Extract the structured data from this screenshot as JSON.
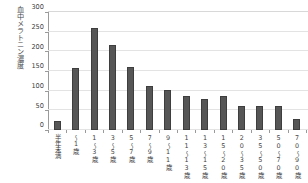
{
  "chart_data": {
    "type": "bar",
    "title": "",
    "ylabel": "血中メラトニン濃度（pg/ml）",
    "ylabel_parts": [
      "血中メラトニン濃度",
      "（pg/㎖）"
    ],
    "xlabel": "",
    "ylim": [
      0,
      300
    ],
    "yticks": [
      0,
      50,
      100,
      150,
      200,
      250,
      300
    ],
    "ytick_labels": [
      "0",
      "50",
      "100",
      "150",
      "200",
      "250",
      "300"
    ],
    "grid": true,
    "legend": "none",
    "bar_color": "#565656",
    "bar_edge_color": "#3e3e3e",
    "grid_color": "#e3e3e3",
    "axis_color": "#9a9a9a",
    "categories": [
      "半年未満",
      "〜1歳",
      "1〜3歳",
      "3〜5歳",
      "5〜7歳",
      "7〜9歳",
      "9〜11歳",
      "11〜13歳",
      "13〜15歳",
      "15〜20歳",
      "20〜35歳",
      "35〜50歳",
      "50〜70歳",
      "70〜90歳"
    ],
    "values": [
      23,
      157,
      259,
      217,
      161,
      112,
      102,
      86,
      80,
      87,
      61,
      61,
      62,
      28
    ]
  }
}
